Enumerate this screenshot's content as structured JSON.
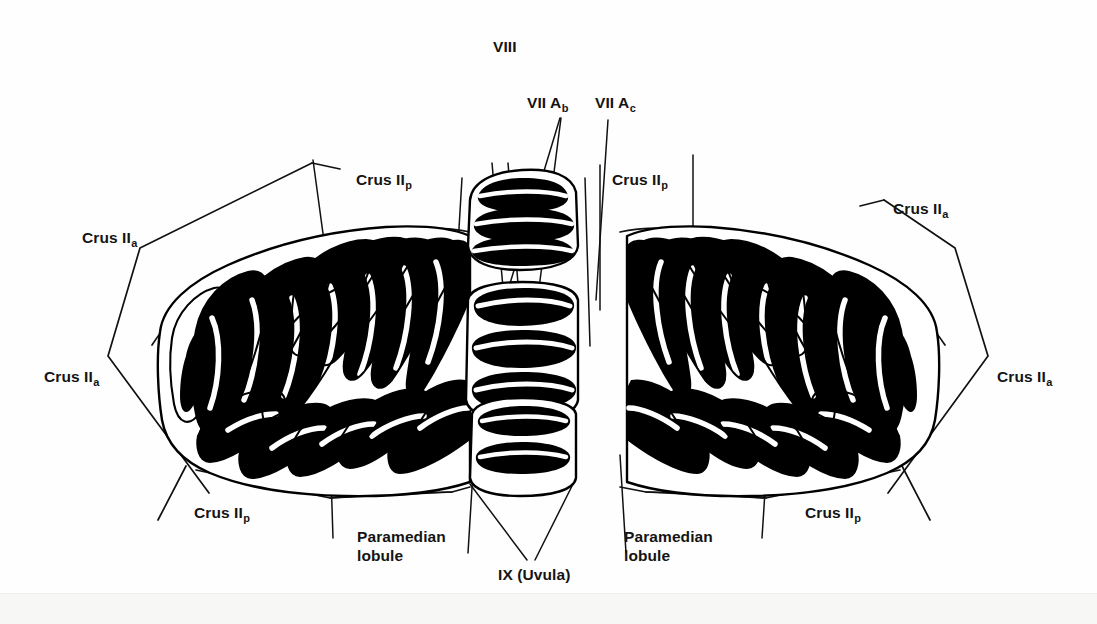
{
  "figure": {
    "background_color": "#fefefe",
    "ink_color": "#000000",
    "width": 1097,
    "height": 624
  },
  "labels": [
    {
      "id": "viii",
      "text": "VIII",
      "sub": "",
      "x": 493,
      "y": 38,
      "name": "label-lobule-viii"
    },
    {
      "id": "vii-ab",
      "text": "VII A",
      "sub": "b",
      "x": 527,
      "y": 94,
      "name": "label-lobule-vii-a-b"
    },
    {
      "id": "vii-ac",
      "text": "VII A",
      "sub": "c",
      "x": 595,
      "y": 94,
      "name": "label-lobule-vii-a-c"
    },
    {
      "id": "crus2p-left-top",
      "text": "Crus II",
      "sub": "p",
      "x": 356,
      "y": 171,
      "name": "label-crus-iip-left-top"
    },
    {
      "id": "crus2a-left-top",
      "text": "Crus II",
      "sub": "a",
      "x": 82,
      "y": 229,
      "name": "label-crus-iia-left-top"
    },
    {
      "id": "crus2a-left-mid",
      "text": "Crus II",
      "sub": "a",
      "x": 44,
      "y": 368,
      "name": "label-crus-iia-left-mid"
    },
    {
      "id": "crus2p-left-bot",
      "text": "Crus II",
      "sub": "p",
      "x": 194,
      "y": 504,
      "name": "label-crus-iip-left-bottom"
    },
    {
      "id": "paramed-left",
      "text": "Paramedian",
      "sub": "",
      "x": 357,
      "y": 528,
      "name": "label-paramedian-lobule-left",
      "line2": "lobule"
    },
    {
      "id": "ix-uvula",
      "text": "IX (Uvula)",
      "sub": "",
      "x": 498,
      "y": 566,
      "name": "label-lobule-ix-uvula"
    },
    {
      "id": "paramed-right",
      "text": "Paramedian",
      "sub": "",
      "x": 624,
      "y": 528,
      "name": "label-paramedian-lobule-right",
      "line2": "lobule"
    },
    {
      "id": "crus2p-right-bot",
      "text": "Crus II",
      "sub": "p",
      "x": 805,
      "y": 504,
      "name": "label-crus-iip-right-bottom"
    },
    {
      "id": "crus2p-right-top",
      "text": "Crus II",
      "sub": "p",
      "x": 612,
      "y": 171,
      "name": "label-crus-iip-right-top"
    },
    {
      "id": "crus2a-right-top",
      "text": "Crus II",
      "sub": "a",
      "x": 893,
      "y": 200,
      "name": "label-crus-iia-right-top"
    },
    {
      "id": "crus2a-right-mid",
      "text": "Crus II",
      "sub": "a",
      "x": 997,
      "y": 368,
      "name": "label-crus-iia-right-mid"
    }
  ],
  "structures": {
    "left_hemisphere": "Left cerebellar hemisphere with folded folia (black medullary laminae)",
    "right_hemisphere": "Right cerebellar hemisphere with folded folia (black medullary laminae)",
    "vermis": "Central vermis with transverse lobules VIII, VII A and IX (Uvula)"
  }
}
